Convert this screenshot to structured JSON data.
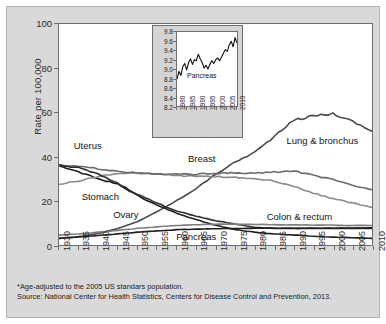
{
  "chart_data": {
    "type": "line",
    "title": "",
    "xlabel": "",
    "ylabel": "Rate per 100,000",
    "xlim": [
      1930,
      2010
    ],
    "ylim": [
      0,
      100
    ],
    "grid": false,
    "legend_position": "inline-labels",
    "x_ticks": [
      "1930",
      "1935",
      "1940",
      "1945",
      "1950",
      "1955",
      "1960",
      "1965",
      "1970",
      "1975",
      "1980",
      "1985",
      "1990",
      "1995",
      "2000",
      "2005",
      "2010"
    ],
    "y_ticks": [
      "0",
      "20",
      "40",
      "60",
      "80",
      "100"
    ],
    "x": [
      1930,
      1935,
      1940,
      1945,
      1950,
      1955,
      1960,
      1965,
      1970,
      1975,
      1980,
      1985,
      1990,
      1995,
      2000,
      2005,
      2010
    ],
    "series": [
      {
        "name": "Lung & bronchus",
        "color": "#4a4a4a",
        "values": [
          3.0,
          3.8,
          5.2,
          7.4,
          10.6,
          15.0,
          20.0,
          25.5,
          32.0,
          37.5,
          42.0,
          49.0,
          56.5,
          58.5,
          59.5,
          56.0,
          51.5
        ]
      },
      {
        "name": "Stomach",
        "color": "#1f1f1f",
        "values": [
          36.0,
          33.0,
          30.0,
          27.5,
          22.5,
          18.0,
          14.5,
          11.5,
          9.0,
          7.0,
          5.8,
          5.0,
          4.5,
          4.0,
          3.6,
          3.3,
          3.0
        ]
      },
      {
        "name": "Colon & rectum",
        "color": "#8a8a8a",
        "values": [
          27.5,
          29.0,
          31.0,
          32.5,
          32.5,
          32.0,
          31.5,
          31.0,
          31.0,
          30.5,
          30.0,
          29.0,
          26.5,
          23.5,
          21.0,
          19.0,
          17.0
        ]
      },
      {
        "name": "Breast",
        "color": "#6a6a6a",
        "values": [
          36.0,
          35.5,
          34.5,
          33.5,
          32.5,
          32.0,
          32.0,
          32.0,
          32.5,
          32.5,
          32.5,
          33.0,
          33.5,
          31.5,
          29.5,
          27.0,
          25.0
        ]
      },
      {
        "name": "Uterus",
        "color": "#2e2e2e",
        "values": [
          36.0,
          35.0,
          32.0,
          28.0,
          23.0,
          19.0,
          15.5,
          13.0,
          11.0,
          9.5,
          8.0,
          7.5,
          7.5,
          7.5,
          7.5,
          7.5,
          7.5
        ]
      },
      {
        "name": "Ovary",
        "color": "#7d7d7d",
        "values": [
          4.5,
          5.0,
          5.8,
          6.6,
          7.5,
          8.2,
          8.8,
          9.2,
          9.4,
          9.4,
          9.3,
          9.2,
          9.1,
          9.0,
          9.0,
          8.8,
          8.8
        ]
      },
      {
        "name": "Pancreas",
        "color": "#1f1f1f",
        "values": [
          3.0,
          3.6,
          4.3,
          5.0,
          5.8,
          6.4,
          6.9,
          7.2,
          7.4,
          7.5,
          7.6,
          7.6,
          7.6,
          7.6,
          7.6,
          7.7,
          7.8
        ]
      }
    ],
    "annotations": [
      {
        "text": "Uterus",
        "x": 1934,
        "y": 45
      },
      {
        "text": "Stomach",
        "x": 1936,
        "y": 22
      },
      {
        "text": "Ovary",
        "x": 1944,
        "y": 14
      },
      {
        "text": "Breast",
        "x": 1963,
        "y": 39
      },
      {
        "text": "Pancreas",
        "x": 1960,
        "y": 4
      },
      {
        "text": "Lung & bronchus",
        "x": 1988,
        "y": 47
      },
      {
        "text": "Colon & rectum",
        "x": 1983,
        "y": 13
      }
    ]
  },
  "inset_chart": {
    "type": "line",
    "series_name": "Pancreas",
    "ylabel": "",
    "xlabel": "",
    "xlim": [
      1980,
      2011
    ],
    "ylim": [
      8.2,
      9.8
    ],
    "y_ticks": [
      "9.8",
      "9.6",
      "9.4",
      "9.2",
      "9.0",
      "8.8",
      "8.6",
      "8.4",
      "8.2"
    ],
    "x_ticks": [
      "1980",
      "1985",
      "1990",
      "1995",
      "2000",
      "2005",
      "2010"
    ],
    "x": [
      1980,
      1981,
      1982,
      1983,
      1984,
      1985,
      1986,
      1987,
      1988,
      1989,
      1990,
      1991,
      1992,
      1993,
      1994,
      1995,
      1996,
      1997,
      1998,
      1999,
      2000,
      2001,
      2002,
      2003,
      2004,
      2005,
      2006,
      2007,
      2008,
      2009,
      2010,
      2011
    ],
    "values": [
      8.78,
      8.95,
      8.86,
      9.05,
      9.12,
      8.98,
      9.14,
      9.22,
      9.1,
      9.2,
      9.18,
      9.32,
      9.22,
      9.14,
      9.02,
      9.08,
      9.0,
      9.1,
      9.18,
      9.12,
      9.2,
      9.24,
      9.18,
      9.26,
      9.34,
      9.42,
      9.38,
      9.52,
      9.6,
      9.48,
      9.68,
      9.56
    ]
  },
  "footnotes": {
    "line1": "*Age-adjusted to the 2005 US standars population.",
    "line2": "Source: National Center  for Health Statistics, Centers for Disease Control and Prevention, 2013."
  },
  "colors": {
    "figure_background": "#d9d9d9",
    "plot_background": "#ffffff",
    "axis": "#6e6e6e",
    "text": "#1a1a1a"
  }
}
